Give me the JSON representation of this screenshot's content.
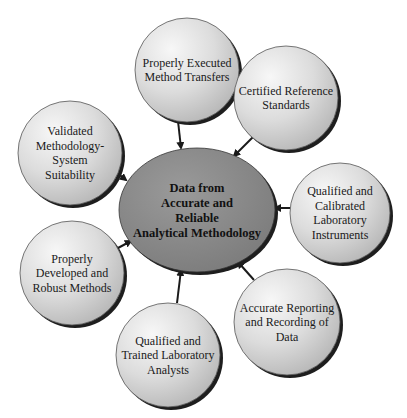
{
  "diagram": {
    "center": {
      "id": "center",
      "lines": [
        "Data from",
        "Accurate and",
        "Reliable",
        "Analytical Methodology"
      ],
      "cx": 197,
      "cy": 210,
      "rx": 78,
      "ry": 62,
      "fill": "#8a8a8a"
    },
    "nodes": [
      {
        "id": "method-transfers",
        "lines": [
          "Properly Executed",
          "Method Transfers"
        ],
        "cx": 187,
        "cy": 70,
        "r": 52
      },
      {
        "id": "reference-standards",
        "lines": [
          "Certified Reference",
          "Standards"
        ],
        "cx": 286,
        "cy": 98,
        "r": 52
      },
      {
        "id": "system-suitability",
        "lines": [
          "Validated",
          "Methodology-",
          "System",
          "Suitability"
        ],
        "cx": 70,
        "cy": 153,
        "r": 52
      },
      {
        "id": "lab-instruments",
        "lines": [
          "Qualified and",
          "Calibrated",
          "Laboratory",
          "Instruments"
        ],
        "cx": 340,
        "cy": 213,
        "r": 50
      },
      {
        "id": "robust-methods",
        "lines": [
          "Properly",
          "Developed and",
          "Robust Methods"
        ],
        "cx": 72,
        "cy": 273,
        "r": 52
      },
      {
        "id": "reporting-recording",
        "lines": [
          "Accurate Reporting",
          "and Recording of",
          "Data"
        ],
        "cx": 287,
        "cy": 322,
        "r": 53
      },
      {
        "id": "lab-analysts",
        "lines": [
          "Qualified and",
          "Trained Laboratory",
          "Analysts"
        ],
        "cx": 168,
        "cy": 355,
        "r": 52
      }
    ],
    "arrows": [
      {
        "from": "method-transfers",
        "x1": 178,
        "y1": 121,
        "x2": 181,
        "y2": 148
      },
      {
        "from": "reference-standards",
        "x1": 253,
        "y1": 137,
        "x2": 234,
        "y2": 156
      },
      {
        "from": "system-suitability",
        "x1": 116,
        "y1": 172,
        "x2": 126,
        "y2": 180
      },
      {
        "from": "lab-instruments",
        "x1": 290,
        "y1": 208,
        "x2": 275,
        "y2": 208
      },
      {
        "from": "robust-methods",
        "x1": 118,
        "y1": 248,
        "x2": 131,
        "y2": 241
      },
      {
        "from": "reporting-recording",
        "x1": 254,
        "y1": 280,
        "x2": 238,
        "y2": 262
      },
      {
        "from": "lab-analysts",
        "x1": 177,
        "y1": 303,
        "x2": 181,
        "y2": 270
      }
    ],
    "colors": {
      "node_light": "#f4f4f4",
      "node_mid": "#c9c9c9",
      "node_shadow": "#1e1e1e",
      "center_fill": "#8a8a8a",
      "arrow": "#1a1a1a"
    }
  }
}
